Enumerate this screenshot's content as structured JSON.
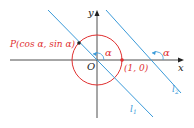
{
  "labels": {
    "y_axis": "y",
    "x_axis": "x",
    "origin": "O",
    "point_p": "P(cos α, sin α)",
    "point_unit": "(1, 0)",
    "alpha_origin": "α",
    "alpha_l2": "α",
    "line1": "l",
    "line1_sub": "1",
    "line2": "l",
    "line2_sub": "2"
  },
  "colors": {
    "axis": "#222222",
    "circle": "#e03030",
    "line": "#3a9ad9",
    "angle": "#3a9ad9"
  }
}
